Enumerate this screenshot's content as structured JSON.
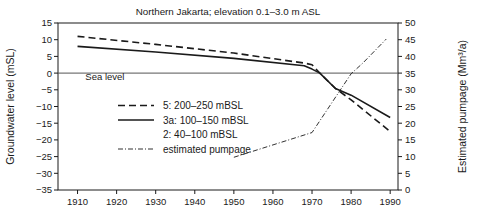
{
  "chart_data": {
    "type": "line",
    "title": "Northern Jakarta; elevation 0.1–3.0 m ASL",
    "xlabel": "",
    "ylabel": "Groundwater level (mSL)",
    "y2label": "Estimated pumpage (Mm³/a)",
    "xlim": [
      1905,
      1992
    ],
    "ylim": [
      -35,
      15
    ],
    "y2lim": [
      0,
      50
    ],
    "grid": false,
    "legend_position": "center-left",
    "x_ticks": [
      1910,
      1920,
      1930,
      1940,
      1950,
      1960,
      1970,
      1980,
      1990
    ],
    "y_ticks": [
      15,
      10,
      5,
      0,
      -5,
      -10,
      -15,
      -20,
      -25,
      -30,
      -35
    ],
    "y2_ticks": [
      50,
      45,
      40,
      35,
      30,
      25,
      20,
      15,
      10,
      5,
      0
    ],
    "annotations": [
      {
        "text": "Sea level",
        "x": 1912,
        "y": -2.2
      }
    ],
    "series": [
      {
        "name": "5: 200–250 mBSL",
        "style": "dashed",
        "axis": "left",
        "points": [
          [
            1910,
            11.0
          ],
          [
            1930,
            8.6
          ],
          [
            1950,
            6.0
          ],
          [
            1968,
            3.0
          ],
          [
            1970,
            2.5
          ],
          [
            1972,
            0.0
          ],
          [
            1976,
            -4.6
          ],
          [
            1980,
            -8.0
          ],
          [
            1990,
            -17.5
          ]
        ]
      },
      {
        "name": "3a: 100–150 mBSL",
        "style": "solid",
        "axis": "left",
        "points": [
          [
            1910,
            8.0
          ],
          [
            1930,
            6.3
          ],
          [
            1950,
            4.4
          ],
          [
            1968,
            2.2
          ],
          [
            1970,
            1.2
          ],
          [
            1972,
            0.0
          ],
          [
            1976,
            -4.6
          ],
          [
            1980,
            -6.6
          ],
          [
            1990,
            -13.3
          ]
        ]
      },
      {
        "name": "2: 40–100 mBSL",
        "style": "solid",
        "axis": "left",
        "points": []
      },
      {
        "name": "estimated pumpage",
        "style": "dash-dot",
        "axis": "right",
        "points": [
          [
            1950,
            9.8
          ],
          [
            1960,
            13.5
          ],
          [
            1970,
            17.2
          ],
          [
            1980,
            34.8
          ],
          [
            1983,
            38.0
          ],
          [
            1989,
            45.2
          ]
        ]
      }
    ],
    "legend": [
      {
        "label": "5: 200–250 mBSL",
        "style": "dashed"
      },
      {
        "label": "3a: 100–150 mBSL",
        "style": "solid"
      },
      {
        "label": "2: 40–100 mBSL",
        "style": "none"
      },
      {
        "label": "estimated pumpage",
        "style": "dash-dot"
      }
    ],
    "colors": {
      "line": "#1a1a1a",
      "sea_level": "#555555",
      "background": "#ffffff"
    }
  }
}
